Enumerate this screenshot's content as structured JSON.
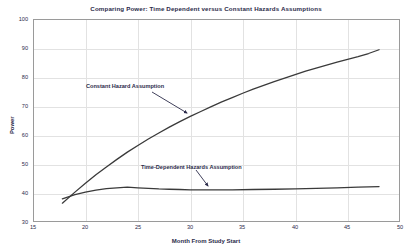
{
  "chart_data": {
    "type": "line",
    "title": "Comparing Power: Time Dependent versus Constant Hazards Assumptions",
    "xlabel": "Month From Study Start",
    "ylabel": "Power",
    "xlim": [
      15,
      50
    ],
    "ylim": [
      30,
      100
    ],
    "xticks": [
      15,
      20,
      25,
      30,
      35,
      40,
      45,
      50
    ],
    "yticks": [
      30,
      40,
      50,
      60,
      70,
      80,
      90,
      100
    ],
    "grid": true,
    "legend_position": "none",
    "series": [
      {
        "name": "Constant Hazard Assumption",
        "color": "#3a3a3a",
        "x": [
          17.8,
          19,
          20,
          21,
          22,
          23,
          24,
          25,
          26,
          27,
          28,
          29,
          30,
          31,
          32,
          33,
          34,
          35,
          36,
          37,
          38,
          39,
          40,
          41,
          42,
          43,
          44,
          45,
          46,
          47,
          48
        ],
        "values": [
          36.5,
          40.3,
          43.4,
          46.3,
          49.0,
          51.6,
          54.1,
          56.4,
          58.6,
          60.7,
          62.7,
          64.6,
          66.4,
          68.1,
          69.8,
          71.4,
          72.9,
          74.4,
          75.8,
          77.1,
          78.4,
          79.6,
          80.8,
          82.0,
          83.1,
          84.1,
          85.1,
          86.1,
          87.0,
          88.1,
          89.4
        ]
      },
      {
        "name": "Time-Dependent Hazards Assumption",
        "color": "#3a3a3a",
        "x": [
          17.8,
          19,
          20,
          21,
          22,
          23,
          24,
          25,
          26,
          27,
          28,
          29,
          30,
          32,
          34,
          36,
          38,
          40,
          42,
          44,
          46,
          48
        ],
        "values": [
          38.0,
          39.4,
          40.3,
          41.0,
          41.5,
          41.8,
          42.0,
          41.8,
          41.6,
          41.4,
          41.3,
          41.2,
          41.1,
          41.1,
          41.1,
          41.2,
          41.3,
          41.4,
          41.6,
          41.8,
          42.0,
          42.2
        ]
      }
    ],
    "annotations": [
      {
        "text": "Constant Hazard Assumption",
        "label_x": 86,
        "label_y": 83,
        "arrow_from_x": 152,
        "arrow_from_y": 92,
        "arrow_to_x": 187,
        "arrow_to_y": 113
      },
      {
        "text": "Time-Dependent Hazards Assumption",
        "label_x": 141,
        "label_y": 164,
        "arrow_from_x": 196,
        "arrow_from_y": 170,
        "arrow_to_x": 208,
        "arrow_to_y": 186
      }
    ]
  }
}
